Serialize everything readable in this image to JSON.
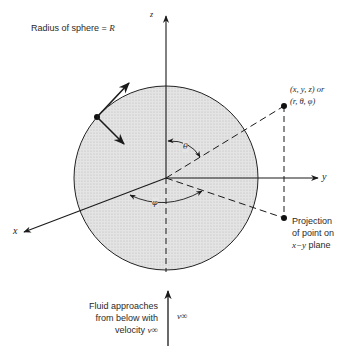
{
  "title_note": {
    "prefix": "Radius of sphere = ",
    "symbol": "R"
  },
  "axes": {
    "x": "x",
    "y": "y",
    "z": "z"
  },
  "point_label": {
    "line1": "(x, y, z) or",
    "line2": "(r, θ, φ)"
  },
  "projection_label": {
    "line1": "Projection",
    "line2": "of point on",
    "line3_symbol": "x−y",
    "line3_text": " plane"
  },
  "angles": {
    "theta": "θ",
    "phi": "φ"
  },
  "flow_note": {
    "line1": "Fluid approaches",
    "line2": "from below with",
    "line3_prefix": "velocity ",
    "line3_symbol": "v∞"
  },
  "velocity_label": "v∞",
  "colors": {
    "sphere_fill": "#dcdcdc",
    "ink": "#1a1a1a"
  }
}
